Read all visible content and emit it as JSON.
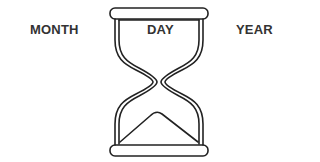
{
  "labels": {
    "month": "MONTH",
    "day": "DAY",
    "year": "YEAR"
  },
  "illustration": {
    "icon": "hourglass-icon",
    "stroke_color": "#222222",
    "text_color": "#333333"
  }
}
